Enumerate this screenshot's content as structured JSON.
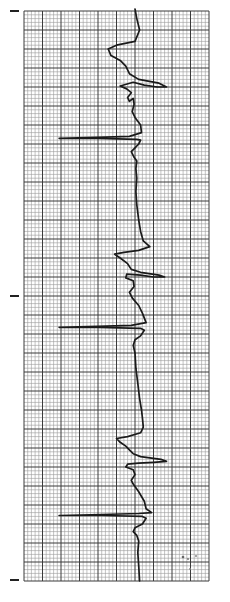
{
  "strip": {
    "title": "",
    "paper_color": "#ffffff",
    "grid_minor_color": "#9a9a9a",
    "grid_major_color": "#3a3a3a",
    "trace_color": "#1a1a1a",
    "orientation": "vertical",
    "minor_per_major": 5,
    "major_cols": 10,
    "major_rows": 30
  },
  "trace": {
    "description": "ECG waveform drawn along grid paper; x = horizontal deflection in major grid units (0-10), y = position along strip in major grid units (0-30)",
    "points": [
      [
        6.0,
        0.0
      ],
      [
        6.1,
        0.4
      ],
      [
        6.25,
        1.0
      ],
      [
        6.0,
        1.6
      ],
      [
        5.0,
        1.8
      ],
      [
        4.55,
        2.0
      ],
      [
        4.7,
        2.35
      ],
      [
        5.2,
        2.6
      ],
      [
        5.5,
        2.9
      ],
      [
        5.7,
        3.3
      ],
      [
        6.2,
        3.6
      ],
      [
        7.3,
        3.8
      ],
      [
        7.7,
        4.0
      ],
      [
        7.2,
        4.0
      ],
      [
        6.5,
        3.9
      ],
      [
        5.9,
        3.75
      ],
      [
        5.2,
        3.95
      ],
      [
        5.55,
        4.1
      ],
      [
        5.8,
        4.3
      ],
      [
        5.6,
        4.55
      ],
      [
        5.7,
        4.75
      ],
      [
        5.9,
        4.6
      ],
      [
        5.95,
        4.9
      ],
      [
        5.85,
        5.3
      ],
      [
        6.0,
        5.6
      ],
      [
        6.3,
        6.0
      ],
      [
        6.35,
        6.4
      ],
      [
        5.7,
        6.6
      ],
      [
        4.0,
        6.65
      ],
      [
        1.9,
        6.7
      ],
      [
        4.0,
        6.7
      ],
      [
        6.1,
        6.75
      ],
      [
        6.3,
        6.8
      ],
      [
        6.2,
        7.0
      ],
      [
        6.0,
        7.2
      ],
      [
        5.8,
        7.4
      ],
      [
        5.95,
        7.7
      ],
      [
        6.1,
        7.9
      ],
      [
        6.05,
        8.3
      ],
      [
        6.1,
        8.8
      ],
      [
        6.05,
        9.5
      ],
      [
        6.1,
        10.2
      ],
      [
        6.2,
        11.0
      ],
      [
        6.3,
        11.6
      ],
      [
        6.45,
        12.1
      ],
      [
        6.8,
        12.4
      ],
      [
        6.2,
        12.6
      ],
      [
        5.4,
        12.7
      ],
      [
        4.9,
        12.8
      ],
      [
        5.2,
        13.0
      ],
      [
        5.6,
        13.3
      ],
      [
        5.8,
        13.6
      ],
      [
        6.3,
        13.75
      ],
      [
        7.3,
        13.9
      ],
      [
        7.6,
        14.0
      ],
      [
        7.0,
        14.0
      ],
      [
        6.3,
        13.9
      ],
      [
        5.55,
        13.85
      ],
      [
        5.5,
        14.05
      ],
      [
        5.9,
        14.2
      ],
      [
        5.95,
        14.5
      ],
      [
        5.7,
        14.8
      ],
      [
        5.85,
        15.1
      ],
      [
        6.2,
        15.5
      ],
      [
        6.4,
        15.9
      ],
      [
        6.6,
        16.4
      ],
      [
        5.8,
        16.55
      ],
      [
        4.0,
        16.6
      ],
      [
        1.9,
        16.65
      ],
      [
        4.0,
        16.65
      ],
      [
        6.3,
        16.7
      ],
      [
        6.5,
        16.8
      ],
      [
        6.3,
        17.1
      ],
      [
        6.0,
        17.3
      ],
      [
        5.9,
        17.6
      ],
      [
        6.0,
        18.0
      ],
      [
        6.05,
        18.8
      ],
      [
        6.15,
        19.6
      ],
      [
        6.25,
        20.4
      ],
      [
        6.35,
        21.0
      ],
      [
        6.4,
        21.4
      ],
      [
        6.45,
        21.9
      ],
      [
        6.3,
        22.2
      ],
      [
        5.6,
        22.4
      ],
      [
        5.0,
        22.5
      ],
      [
        5.2,
        22.7
      ],
      [
        5.5,
        22.9
      ],
      [
        5.7,
        23.1
      ],
      [
        5.9,
        23.3
      ],
      [
        6.3,
        23.45
      ],
      [
        7.4,
        23.6
      ],
      [
        7.7,
        23.7
      ],
      [
        7.0,
        23.75
      ],
      [
        6.2,
        23.8
      ],
      [
        5.6,
        23.85
      ],
      [
        5.5,
        24.0
      ],
      [
        5.9,
        24.15
      ],
      [
        6.0,
        24.4
      ],
      [
        5.8,
        24.7
      ],
      [
        5.9,
        24.9
      ],
      [
        6.2,
        25.3
      ],
      [
        6.5,
        25.8
      ],
      [
        6.6,
        26.2
      ],
      [
        6.9,
        26.4
      ],
      [
        6.2,
        26.45
      ],
      [
        4.2,
        26.5
      ],
      [
        1.9,
        26.55
      ],
      [
        4.2,
        26.55
      ],
      [
        6.4,
        26.6
      ],
      [
        6.6,
        26.7
      ],
      [
        6.4,
        27.0
      ],
      [
        6.0,
        27.2
      ],
      [
        5.9,
        27.4
      ],
      [
        6.1,
        27.6
      ],
      [
        6.2,
        27.9
      ],
      [
        6.15,
        28.5
      ],
      [
        6.2,
        29.2
      ],
      [
        6.25,
        30.0
      ]
    ]
  },
  "markers": [
    {
      "name": "calibration-mark-top"
    },
    {
      "name": "calibration-mark-middle"
    },
    {
      "name": "calibration-mark-bottom"
    }
  ],
  "annotation": {
    "text": "",
    "note": "faint illegible handwritten marks near lower-right corner"
  }
}
